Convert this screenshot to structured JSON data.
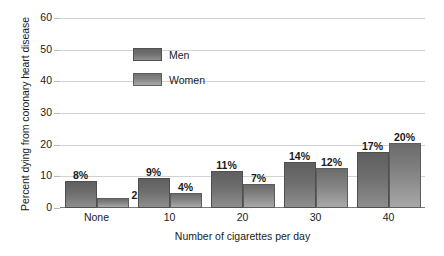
{
  "chart_data": {
    "type": "bar",
    "title": "",
    "categories": [
      "None",
      "10",
      "20",
      "30",
      "40"
    ],
    "series": [
      {
        "name": "Men",
        "values": [
          8,
          9,
          11,
          14,
          17
        ],
        "labels": [
          "8%",
          "9%",
          "11%",
          "14%",
          "17%"
        ],
        "color": "#6e6e6e"
      },
      {
        "name": "Women",
        "values": [
          2.5,
          4,
          7,
          12,
          20
        ],
        "labels": [
          "2.5%",
          "4%",
          "7%",
          "12%",
          "20%"
        ],
        "color": "#838383"
      }
    ],
    "xlabel": "Number of cigarettes per day",
    "ylabel": "Percent dying from coronary heart disease",
    "ylim": [
      0,
      60
    ],
    "yticks": [
      "0",
      "10",
      "20",
      "30",
      "40",
      "50",
      "60"
    ],
    "grid": true,
    "legend_position": "inside-top-left"
  },
  "legend": {
    "items": [
      {
        "label": "Men"
      },
      {
        "label": "Women"
      }
    ]
  },
  "axes": {
    "y_title": "Percent dying from coronary heart disease",
    "x_title": "Number of cigarettes per day"
  }
}
